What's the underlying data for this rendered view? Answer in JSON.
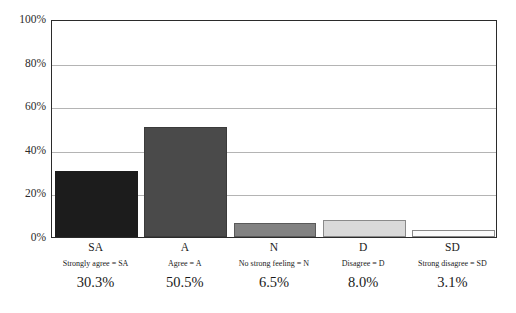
{
  "chart_data": {
    "type": "bar",
    "title": "",
    "xlabel": "",
    "ylabel": "",
    "ylim": [
      0,
      100
    ],
    "yticks": [
      "0%",
      "20%",
      "40%",
      "60%",
      "80%",
      "100%"
    ],
    "ytick_values": [
      0,
      20,
      40,
      60,
      80,
      100
    ],
    "grid": true,
    "legend_position": "below-axis",
    "categories": [
      "SA",
      "A",
      "N",
      "D",
      "SD"
    ],
    "values": [
      30.3,
      50.5,
      6.5,
      8.0,
      3.1
    ],
    "value_labels": [
      "30.3%",
      "50.5%",
      "6.5%",
      "8.0%",
      "3.1%"
    ],
    "legend_entries": [
      "Strongly agree = SA",
      "Agree = A",
      "No strong feeling = N",
      "Disagree = D",
      "Strong disagree = SD"
    ],
    "bar_colors": [
      "#1c1c1c",
      "#4a4a4a",
      "#828282",
      "#d9d9d9",
      "#fcfcfc"
    ],
    "bar_edge_colors": [
      "#1c1c1c",
      "#3b3b3b",
      "#5a5a5a",
      "#8a8a8a",
      "#8a8a8a"
    ],
    "axis_color": "#2b2b2b",
    "grid_color": "#b4b4b4",
    "background": "#ffffff"
  }
}
